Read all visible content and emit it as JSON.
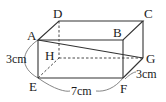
{
  "diagram": {
    "type": "rectangular-prism",
    "vertices": {
      "A": {
        "label": "A",
        "x": 38,
        "y": 40
      },
      "B": {
        "label": "B",
        "x": 123,
        "y": 40
      },
      "C": {
        "label": "C",
        "x": 143,
        "y": 21
      },
      "D": {
        "label": "D",
        "x": 59,
        "y": 21
      },
      "E": {
        "label": "E",
        "x": 38,
        "y": 78
      },
      "F": {
        "label": "F",
        "x": 123,
        "y": 78
      },
      "G": {
        "label": "G",
        "x": 143,
        "y": 58
      },
      "H": {
        "label": "H",
        "x": 59,
        "y": 58
      }
    },
    "visible_edges": [
      [
        "A",
        "B"
      ],
      [
        "B",
        "C"
      ],
      [
        "C",
        "D"
      ],
      [
        "D",
        "A"
      ],
      [
        "A",
        "E"
      ],
      [
        "E",
        "F"
      ],
      [
        "B",
        "F"
      ],
      [
        "F",
        "G"
      ],
      [
        "C",
        "G"
      ]
    ],
    "hidden_edges": [
      [
        "D",
        "H"
      ],
      [
        "E",
        "H"
      ],
      [
        "H",
        "G"
      ]
    ],
    "segments": [
      [
        "A",
        "G"
      ]
    ],
    "dimensions": {
      "height": {
        "label": "3cm",
        "edge": "AE"
      },
      "length": {
        "label": "7cm",
        "edge": "EF"
      },
      "depth": {
        "label": "3cm",
        "edge": "FG"
      }
    }
  }
}
